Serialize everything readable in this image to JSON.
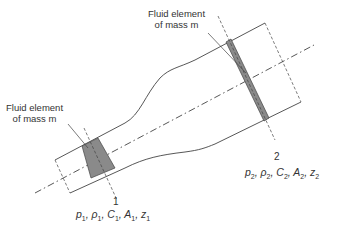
{
  "diagram": {
    "type": "flow-through-duct",
    "colors": {
      "stroke": "#444444",
      "fluid_element_fill": "#8a8a8a",
      "background": "#ffffff"
    },
    "labels": {
      "fluid_element_left": [
        "Fluid element",
        "of mass m"
      ],
      "fluid_element_right": [
        "Fluid element",
        "of mass m"
      ],
      "section_1_number": "1",
      "section_2_number": "2",
      "section_1_vars": [
        {
          "sym": "p",
          "sub": "1"
        },
        {
          "sym": "ρ",
          "sub": "1"
        },
        {
          "sym": "C",
          "sub": "1"
        },
        {
          "sym": "A",
          "sub": "1"
        },
        {
          "sym": "z",
          "sub": "1"
        }
      ],
      "section_2_vars": [
        {
          "sym": "p",
          "sub": "2"
        },
        {
          "sym": "ρ",
          "sub": "2"
        },
        {
          "sym": "C",
          "sub": "2"
        },
        {
          "sym": "A",
          "sub": "2"
        },
        {
          "sym": "z",
          "sub": "2"
        }
      ]
    },
    "label_text": {
      "left_line1": "Fluid element",
      "left_line2": "of mass m",
      "right_line1": "Fluid element",
      "right_line2": "of mass m",
      "sec1": "1",
      "sec2": "2",
      "p1": "p",
      "rho1": "ρ",
      "c1": "C",
      "a1": "A",
      "z1": "z",
      "s1": "1",
      "p2": "p",
      "rho2": "ρ",
      "c2": "C",
      "a2": "A",
      "z2": "z",
      "s2": "2"
    }
  }
}
